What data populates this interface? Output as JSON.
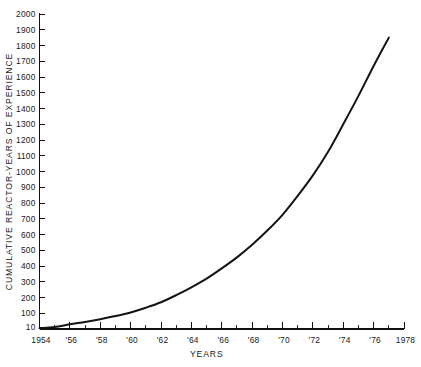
{
  "chart_data": {
    "type": "line",
    "title": "",
    "xlabel": "YEARS",
    "ylabel": "CUMULATIVE REACTOR-YEARS OF EXPERIENCE",
    "xlim": [
      1954,
      1978
    ],
    "ylim": [
      0,
      2000
    ],
    "grid": false,
    "legend": null,
    "x_tick_labels": [
      "1954",
      "'56",
      "'58",
      "'60",
      "'62",
      "'64",
      "'66",
      "'68",
      "'70",
      "'72",
      "'74",
      "'76",
      "1978"
    ],
    "x_tick_values": [
      1954,
      1956,
      1958,
      1960,
      1962,
      1964,
      1966,
      1968,
      1970,
      1972,
      1974,
      1976,
      1978
    ],
    "x_minor_ticks": [
      1955,
      1957,
      1959,
      1961,
      1963,
      1965,
      1967,
      1969,
      1971,
      1973,
      1975,
      1977
    ],
    "y_tick_labels": [
      "10",
      "100",
      "200",
      "300",
      "400",
      "500",
      "600",
      "700",
      "800",
      "900",
      "1000",
      "1100",
      "1200",
      "1300",
      "1400",
      "1500",
      "1600",
      "1700",
      "1800",
      "1900",
      "2000"
    ],
    "y_tick_values": [
      10,
      100,
      200,
      300,
      400,
      500,
      600,
      700,
      800,
      900,
      1000,
      1100,
      1200,
      1300,
      1400,
      1500,
      1600,
      1700,
      1800,
      1900,
      2000
    ],
    "series": [
      {
        "name": "Cumulative reactor-years of experience",
        "color": "#141414",
        "x": [
          1954,
          1955,
          1956,
          1957,
          1958,
          1959,
          1960,
          1961,
          1962,
          1963,
          1964,
          1965,
          1966,
          1967,
          1968,
          1969,
          1970,
          1971,
          1972,
          1973,
          1974,
          1975,
          1976,
          1977
        ],
        "values": [
          5,
          12,
          30,
          45,
          62,
          82,
          105,
          135,
          170,
          215,
          265,
          320,
          385,
          455,
          535,
          625,
          725,
          845,
          975,
          1125,
          1300,
          1480,
          1670,
          1850
        ]
      }
    ]
  },
  "axis_titles": {
    "y": "CUMULATIVE REACTOR-YEARS OF EXPERIENCE",
    "x": "YEARS"
  }
}
